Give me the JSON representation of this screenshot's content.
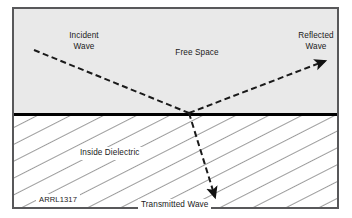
{
  "figure": {
    "credit": "ARRL1317",
    "frame_color": "#58585a",
    "background_color": "#ffffff"
  },
  "regions": [
    {
      "name": "free-space",
      "label": "Free Space",
      "fill": "#e9e9e9",
      "description": "upper half above the dielectric interface"
    },
    {
      "name": "inside-dielectric",
      "label": "Inside Dielectric",
      "fill": "#ffffff",
      "hatch_color": "#3a3a3a",
      "description": "lower half below the interface, diagonal hatching"
    }
  ],
  "interface": {
    "name": "dielectric-boundary",
    "color": "#000000",
    "thickness_px": 3,
    "y_px": 105
  },
  "rays": [
    {
      "name": "incident-wave",
      "label": "Incident Wave",
      "label_lines": [
        "Incident",
        "Wave"
      ],
      "style": "dashed",
      "color": "#1a1a1a",
      "arrowhead": false,
      "from": [
        20,
        41
      ],
      "to": [
        174,
        104
      ]
    },
    {
      "name": "reflected-wave",
      "label": "Reflected Wave",
      "label_lines": [
        "Reflected",
        "Wave"
      ],
      "style": "dashed",
      "color": "#1a1a1a",
      "arrowhead": true,
      "from": [
        174,
        104
      ],
      "to": [
        315,
        50
      ]
    },
    {
      "name": "transmitted-wave",
      "label": "Transmitted Wave",
      "label_lines": [
        "Transmitted Wave"
      ],
      "style": "dashed",
      "color": "#1a1a1a",
      "arrowhead": true,
      "from": [
        174,
        104
      ],
      "to": [
        203,
        193
      ]
    }
  ],
  "labels": {
    "incident": "Incident",
    "wave": "Wave",
    "reflected": "Reflected",
    "free_space": "Free Space",
    "inside_dielectric": "Inside Dielectric",
    "transmitted_wave": "Transmitted Wave",
    "credit": "ARRL1317"
  }
}
